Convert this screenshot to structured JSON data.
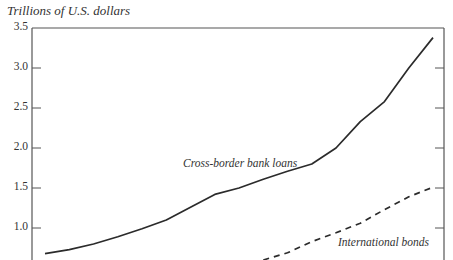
{
  "chart_data": {
    "type": "line",
    "title": "",
    "ylabel": "Trillions of U.S. dollars",
    "xlabel": "",
    "ylim": [
      0.6,
      3.5
    ],
    "yticks": [
      1.0,
      1.5,
      2.0,
      2.5,
      3.0,
      3.5
    ],
    "ytick_labels": [
      "1.0",
      "1.5",
      "2.0",
      "2.5",
      "3.0",
      "3.5"
    ],
    "grid": false,
    "legend": "inline labels",
    "x_index": [
      0,
      1,
      2,
      3,
      4,
      5,
      6,
      7,
      8,
      9,
      10,
      11,
      12,
      13,
      14,
      15,
      16
    ],
    "series": [
      {
        "name": "Cross-border bank loans",
        "style": "solid",
        "values": [
          0.68,
          0.73,
          0.8,
          0.89,
          0.99,
          1.1,
          1.26,
          1.42,
          1.5,
          1.61,
          1.71,
          1.8,
          2.0,
          2.33,
          2.58,
          3.0,
          3.38
        ]
      },
      {
        "name": "International bonds",
        "style": "dashed",
        "values": [
          null,
          null,
          null,
          null,
          null,
          null,
          null,
          null,
          null,
          0.6,
          0.69,
          0.83,
          0.94,
          1.06,
          1.23,
          1.39,
          1.51
        ]
      }
    ],
    "annotations": [
      {
        "text": "Cross-border bank loans",
        "near_series": 0
      },
      {
        "text": "International bonds",
        "near_series": 1
      }
    ]
  },
  "labels": {
    "ylabel": "Trillions of U.S. dollars",
    "loans": "Cross-border bank loans",
    "bonds": "International bonds"
  },
  "colors": {
    "line": "#2b2b2b",
    "axis": "#555555"
  }
}
